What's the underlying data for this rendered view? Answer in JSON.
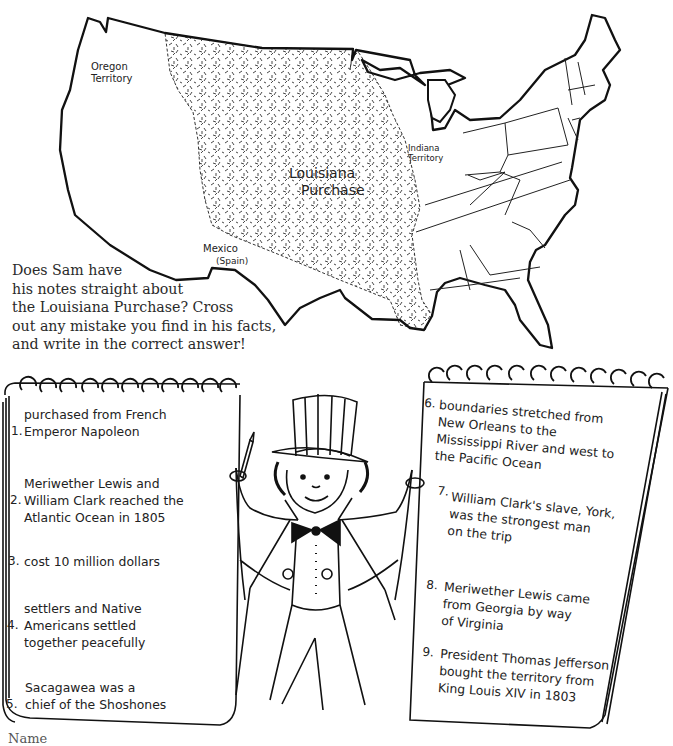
{
  "map": {
    "labels": {
      "oregon": [
        "Oregon",
        "Territory"
      ],
      "louisiana": [
        "Louisiana",
        "Purchase"
      ],
      "indiana": [
        "Indiana",
        "Territory"
      ],
      "mexico": [
        "Mexico",
        "(Spain)"
      ]
    }
  },
  "instructions": {
    "lines": [
      "Does Sam have",
      "his notes straight about",
      "the Louisiana Purchase? Cross",
      "out any mistake you find in his facts,",
      "and write in the correct answer!"
    ]
  },
  "left_notepad": {
    "facts": [
      {
        "number": "1.",
        "lines": [
          "purchased from French",
          "Emperor Napoleon"
        ]
      },
      {
        "number": "2.",
        "lines": [
          "Meriwether Lewis and",
          "William Clark reached the",
          "Atlantic Ocean in 1805"
        ]
      },
      {
        "number": "3.",
        "lines": [
          "cost 10 million dollars"
        ]
      },
      {
        "number": "4.",
        "lines": [
          "settlers and Native",
          "Americans settled",
          "together peacefully"
        ]
      },
      {
        "number": "5.",
        "lines": [
          "Sacagawea was a",
          "chief of the Shoshones"
        ]
      }
    ]
  },
  "right_notepad": {
    "facts": [
      {
        "number": "6.",
        "lines": [
          "boundaries stretched from",
          "New Orleans to the",
          "Mississippi River and west to",
          "the Pacific Ocean"
        ]
      },
      {
        "number": "7.",
        "lines": [
          "William Clark's slave, York,",
          "was the strongest man",
          "on the trip"
        ]
      },
      {
        "number": "8.",
        "lines": [
          "Meriwether Lewis came",
          "from Georgia  by way",
          "of Virginia"
        ]
      },
      {
        "number": "9.",
        "lines": [
          "President Thomas Jefferson",
          "bought the territory from",
          "King Louis XIV in 1803"
        ]
      }
    ]
  },
  "character": {
    "name": "Sam"
  },
  "footer": {
    "name_label": "Name"
  }
}
